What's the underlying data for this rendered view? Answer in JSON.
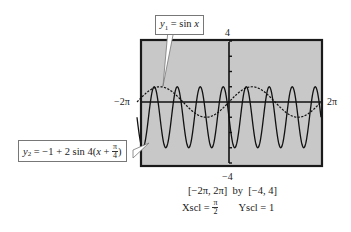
{
  "chart_data": {
    "type": "line",
    "title": "",
    "xlabel": "",
    "ylabel": "",
    "xlim": [
      "-2π",
      "2π"
    ],
    "xlim_numeric": [
      -6.2832,
      6.2832
    ],
    "ylim": [
      -4,
      4
    ],
    "xscl": "π/2",
    "yscl": 1,
    "grid": false,
    "legend": "callouts",
    "series": [
      {
        "name": "y1 = sin x",
        "expression": "sin(x)",
        "style": "dashed",
        "x": [
          -6.2832,
          -4.7124,
          -3.1416,
          -1.5708,
          0,
          1.5708,
          3.1416,
          4.7124,
          6.2832
        ],
        "values": [
          0,
          1,
          0,
          -1,
          0,
          1,
          0,
          -1,
          0
        ]
      },
      {
        "name": "y2 = -1 + 2 sin 4(x + π/4)",
        "expression": "-1 + 2*sin(4*(x + pi/4))",
        "style": "solid",
        "x": [
          -6.2832,
          -5.8905,
          -5.4978,
          -5.1051,
          -4.7124,
          -3.1416,
          -1.5708,
          0,
          1.5708,
          3.1416,
          4.7124,
          6.2832
        ],
        "values": [
          -1,
          -3,
          -1,
          1,
          -1,
          -1,
          -1,
          -1,
          -1,
          -1,
          -1,
          -1
        ],
        "min": -3,
        "max": 1,
        "period": "π/2"
      }
    ],
    "tick_labels": {
      "x_left": "−2π",
      "x_right": "2π",
      "y_top": "4",
      "y_bottom": "−4"
    },
    "annotations": [
      "y1 = sin x",
      "y2 = −1 + 2 sin 4(x + π/4)"
    ]
  },
  "labels": {
    "y_top": "4",
    "y_bottom": "−4",
    "x_left": "−2π",
    "x_right": "2π"
  },
  "callouts": {
    "y1": {
      "var": "y",
      "sub": "1",
      "rest": " = sin ",
      "x": "x"
    },
    "y2": {
      "var": "y",
      "sub": "2",
      "rest": " = −1 + 2 sin 4(",
      "x": "x",
      "plus": " + ",
      "num": "π",
      "den": "4",
      "close": ")"
    }
  },
  "caption": {
    "window": "[−2π, 2π]  by  [−4, 4]",
    "xscl_label": "Xscl = ",
    "xscl_num": "π",
    "xscl_den": "2",
    "yscl": "Yscl = 1"
  },
  "colors": {
    "screen_bg": "#c8c8c8",
    "frame": "#1a1a1a",
    "curve": "#111111"
  }
}
